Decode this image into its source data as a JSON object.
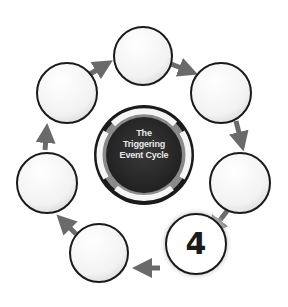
{
  "diagram": {
    "title_lines": [
      "The",
      "Triggering",
      "Event Cycle"
    ],
    "highlighted_step": "4",
    "node_count": 7,
    "nodes": [
      {
        "id": "top",
        "label": ""
      },
      {
        "id": "top-right",
        "label": ""
      },
      {
        "id": "right",
        "label": ""
      },
      {
        "id": "bottom-right",
        "label": "4"
      },
      {
        "id": "bottom-left",
        "label": ""
      },
      {
        "id": "left",
        "label": ""
      },
      {
        "id": "upper-left",
        "label": ""
      }
    ],
    "colors": {
      "center_fill": "#2b2b2b",
      "ring": "#1a1a1a",
      "arrow": "#6a6a6a",
      "node_stroke": "#1a1a1a",
      "node_fill": "#ffffff"
    }
  }
}
